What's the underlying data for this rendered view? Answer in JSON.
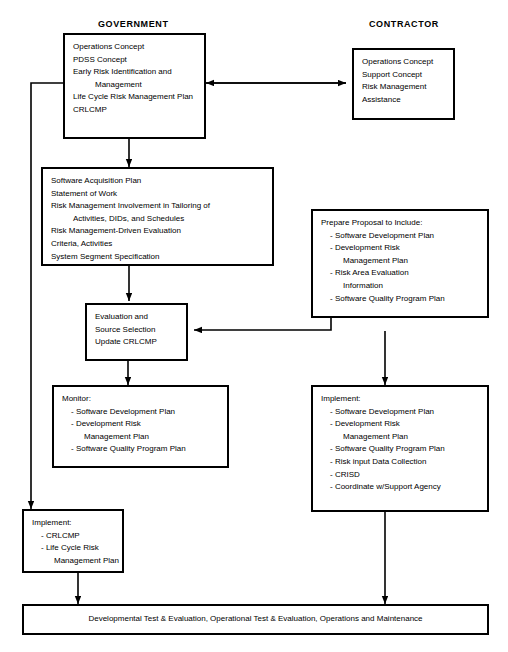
{
  "diagram": {
    "columns": [
      {
        "id": "government",
        "label": "GOVERNMENT"
      },
      {
        "id": "contractor",
        "label": "CONTRACTOR"
      }
    ],
    "colors": {
      "line": "#000000",
      "background": "#ffffff",
      "text": "#000000"
    },
    "boxes": [
      {
        "id": "gov-concepts",
        "column": "government",
        "lines": [
          "Operations Concept",
          "PDSS Concept",
          "Early Risk Identification and",
          "Management",
          "Life Cycle Risk Management Plan",
          "CRLCMP"
        ]
      },
      {
        "id": "contractor-concepts",
        "column": "contractor",
        "lines": [
          "Operations Concept",
          "Support Concept",
          "Risk Management",
          "Assistance"
        ]
      },
      {
        "id": "software-acquisition",
        "column": "government",
        "lines": [
          "Software Acquisition Plan",
          "Statement of Work",
          "Risk Management Involvement in Tailoring of",
          "Activities, DIDs, and Schedules",
          "Risk Management-Driven Evaluation",
          "Criteria, Activities",
          "System Segment Specification"
        ]
      },
      {
        "id": "prepare-proposal",
        "column": "contractor",
        "lines": [
          "Prepare Proposal to Include:",
          "- Software Development Plan",
          "- Development Risk",
          "Management Plan",
          "- Risk Area Evaluation",
          "Information",
          "- Software Quality Program Plan"
        ]
      },
      {
        "id": "evaluation-source-selection",
        "column": "government",
        "lines": [
          "Evaluation and",
          "Source Selection",
          "Update CRLCMP"
        ]
      },
      {
        "id": "monitor",
        "column": "government",
        "lines": [
          "Monitor:",
          "- Software Development Plan",
          "- Development Risk",
          "Management Plan",
          "- Software Quality Program Plan"
        ]
      },
      {
        "id": "contractor-implement",
        "column": "contractor",
        "lines": [
          "Implement:",
          "- Software Development Plan",
          "- Development Risk",
          "Management Plan",
          "- Software Quality Program Plan",
          "- Risk input Data Collection",
          "- CRISD",
          "- Coordinate w/Support Agency"
        ]
      },
      {
        "id": "gov-implement",
        "column": "government",
        "lines": [
          "Implement:",
          "- CRLCMP",
          "- Life Cycle Risk",
          "Management Plan"
        ]
      }
    ],
    "bottom_bar": {
      "id": "test-evaluation-operations",
      "label": "Developmental Test & Evaluation, Operational Test & Evaluation, Operations and Maintenance"
    }
  }
}
